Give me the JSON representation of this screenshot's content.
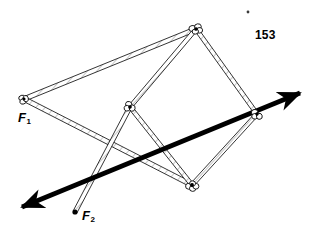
{
  "figure": {
    "number": "153",
    "background_color": "#ffffff",
    "ink_color": "#000000",
    "bar_fill_color": "#ffffff",
    "bar_outline_color": "#1a1a1a",
    "hatch_color": "#8a8a8a",
    "axis_color": "#000000",
    "width": 319,
    "height": 244
  },
  "labels": {
    "f1": {
      "base": "F",
      "sub": "1"
    },
    "f2": {
      "base": "F",
      "sub": "2"
    },
    "figure_number": "153"
  },
  "speck": {
    "cx": 248,
    "cy": 12,
    "r": 1.4
  },
  "joints": [
    {
      "id": "f1-pivot",
      "name": "joint-f1",
      "cx": 24,
      "cy": 99,
      "rx": 5.5,
      "ry": 4.2,
      "rot": -18
    },
    {
      "id": "top-pivot",
      "name": "joint-top",
      "cx": 196,
      "cy": 29,
      "rx": 6.5,
      "ry": 4.6,
      "rot": -8
    },
    {
      "id": "middle-pivot",
      "name": "joint-middle-left",
      "cx": 130,
      "cy": 107,
      "rx": 5.6,
      "ry": 4.4,
      "rot": 12
    },
    {
      "id": "right-pivot",
      "name": "joint-right",
      "cx": 257,
      "cy": 114,
      "rx": 5.6,
      "ry": 4.6,
      "rot": -12
    },
    {
      "id": "bottom-pivot",
      "name": "joint-bottom",
      "cx": 192,
      "cy": 185,
      "rx": 6.2,
      "ry": 4.6,
      "rot": 6
    }
  ],
  "bars": [
    {
      "id": "bar-f1-top",
      "name": "bar-f1-to-top-pivot",
      "x1": 24,
      "y1": 99,
      "x2": 196,
      "y2": 29,
      "w": 4.4
    },
    {
      "id": "bar-f1-bottom",
      "name": "bar-f1-to-bottom-pivot",
      "x1": 24,
      "y1": 99,
      "x2": 192,
      "y2": 185,
      "w": 4.4
    },
    {
      "id": "bar-mid-top",
      "name": "bar-middle-to-top-pivot",
      "x1": 130,
      "y1": 107,
      "x2": 196,
      "y2": 29,
      "w": 4.2
    },
    {
      "id": "bar-mid-f2",
      "name": "bar-middle-to-f2",
      "x1": 130,
      "y1": 107,
      "x2": 75,
      "y2": 212,
      "w": 4.0
    },
    {
      "id": "bar-mid-bottom",
      "name": "bar-middle-to-bottom-pivot",
      "x1": 130,
      "y1": 107,
      "x2": 192,
      "y2": 185,
      "w": 4.2
    },
    {
      "id": "bar-top-right",
      "name": "bar-top-to-right-pivot",
      "x1": 196,
      "y1": 29,
      "x2": 257,
      "y2": 114,
      "w": 4.2
    },
    {
      "id": "bar-right-bottom",
      "name": "bar-right-to-bottom-pivot",
      "x1": 257,
      "y1": 114,
      "x2": 192,
      "y2": 185,
      "w": 4.2
    }
  ],
  "force_points": [
    {
      "id": "f2-point",
      "name": "force-point-f2-dot",
      "cx": 75,
      "cy": 212,
      "r": 2.6
    }
  ],
  "axis_arrow": {
    "name": "double-headed-force-axis",
    "x1": 22,
    "y1": 207,
    "x2": 300,
    "y2": 93,
    "stroke_width": 4.6,
    "head_length": 16,
    "head_width": 11,
    "both_ends": true
  }
}
